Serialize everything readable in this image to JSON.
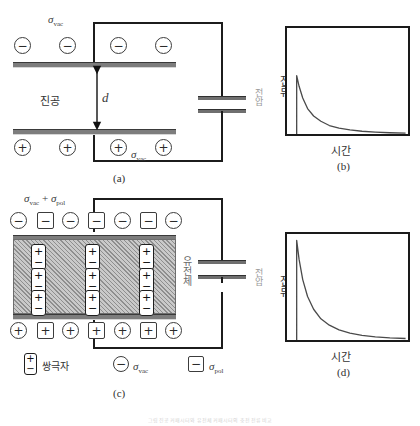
{
  "figure": {
    "panels": [
      {
        "id": "a",
        "label": "(a)"
      },
      {
        "id": "b",
        "label": "(b)"
      },
      {
        "id": "c",
        "label": "(c)"
      },
      {
        "id": "d",
        "label": "(d)"
      }
    ]
  },
  "panel_a": {
    "gap_label": "d",
    "medium_label": "진공",
    "sigma_top": "σ",
    "sigma_top_sub": "vac",
    "sigma_bottom": "σ",
    "sigma_bottom_sub": "vac",
    "source_label": "전압",
    "top_charges": [
      "−",
      "−",
      "−",
      "−"
    ],
    "bottom_charges": [
      "+",
      "+",
      "+",
      "+"
    ]
  },
  "panel_c": {
    "sigma_top_text": "σ",
    "sigma_top_sub1": "vac",
    "sigma_plus": " + ",
    "sigma_top_text2": "σ",
    "sigma_top_sub2": "pol",
    "medium_label": "유전체",
    "source_label": "전압",
    "top_row": [
      {
        "shape": "circle",
        "sign": "−"
      },
      {
        "shape": "square",
        "sign": "−"
      },
      {
        "shape": "circle",
        "sign": "−"
      },
      {
        "shape": "square",
        "sign": "−"
      },
      {
        "shape": "circle",
        "sign": "−"
      },
      {
        "shape": "square",
        "sign": "−"
      },
      {
        "shape": "circle",
        "sign": "−"
      }
    ],
    "bottom_row": [
      {
        "shape": "circle",
        "sign": "+"
      },
      {
        "shape": "square",
        "sign": "+"
      },
      {
        "shape": "circle",
        "sign": "+"
      },
      {
        "shape": "square",
        "sign": "+"
      },
      {
        "shape": "circle",
        "sign": "+"
      },
      {
        "shape": "square",
        "sign": "+"
      },
      {
        "shape": "circle",
        "sign": "+"
      }
    ],
    "dipole_plus": "+",
    "dipole_minus": "−",
    "dipole_rows": 3,
    "dipole_cols": 3
  },
  "legend": {
    "items": [
      {
        "icon": "dipole",
        "label": "쌍극자"
      },
      {
        "icon": "circle-minus",
        "label": "σ",
        "sub": "vac"
      },
      {
        "icon": "square-minus",
        "label": "σ",
        "sub": "pol"
      }
    ]
  },
  "chart_data": [
    {
      "type": "line",
      "id": "b",
      "title": "(b)",
      "xlabel": "시간",
      "ylabel": "전류",
      "grid": false,
      "legend": "none",
      "xlim": [
        0,
        100
      ],
      "ylim": [
        0,
        100
      ],
      "note": "Charging current of vacuum capacitor: vertical rise at t=t0 then exponential decay to zero",
      "series": [
        {
          "name": "전류",
          "x": [
            8,
            8,
            10,
            13,
            17,
            22,
            28,
            35,
            43,
            52,
            62,
            73,
            85,
            98
          ],
          "y": [
            0,
            55,
            45,
            34,
            24,
            17,
            12,
            8,
            5.5,
            3.8,
            2.6,
            1.8,
            1.2,
            0.8
          ]
        }
      ],
      "peak": 55
    },
    {
      "type": "line",
      "id": "d",
      "title": "(d)",
      "xlabel": "시간",
      "ylabel": "전류",
      "grid": false,
      "legend": "none",
      "xlim": [
        0,
        100
      ],
      "ylim": [
        0,
        100
      ],
      "note": "Charging current of dielectric-filled capacitor: larger initial peak, same decay shape",
      "series": [
        {
          "name": "전류",
          "x": [
            8,
            8,
            10,
            13,
            17,
            22,
            28,
            35,
            43,
            52,
            62,
            73,
            85,
            98
          ],
          "y": [
            0,
            94,
            76,
            57,
            41,
            29,
            20,
            14,
            9.5,
            6.5,
            4.4,
            3.0,
            2.0,
            1.4
          ]
        }
      ],
      "peak": 94
    }
  ],
  "bottom_caption": {
    "text": "그림  진공 커패시터와 유전체 커패시터의 충전 전류 비교"
  }
}
